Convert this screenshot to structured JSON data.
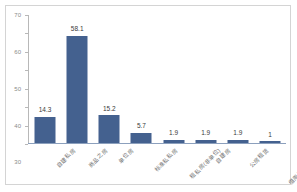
{
  "chart_data": {
    "type": "bar",
    "title": "",
    "subtitle": "",
    "xlabel": "",
    "ylabel": "",
    "ylim": [
      0,
      70
    ],
    "ytick_step": 10,
    "yticks": [
      0,
      10,
      20,
      30,
      40,
      50,
      60,
      70
    ],
    "ytick_labels": [
      "0",
      "10",
      "20",
      "30",
      "40",
      "50",
      "60",
      "70"
    ],
    "grid": false,
    "legend": false,
    "legend_position": "none",
    "categories": [
      "自建私房",
      "商品之房",
      "单位房",
      "标准私私房",
      "租私房(非单位)",
      "自建房",
      "公房租赁",
      "借用自（父母亲）"
    ],
    "values": [
      14.3,
      58.1,
      15.2,
      5.7,
      1.9,
      1.9,
      1.9,
      1
    ],
    "data_labels": [
      "14.3",
      "58.1",
      "15.2",
      "5.7",
      "1.9",
      "1.9",
      "1.9",
      "1"
    ],
    "series": [
      {
        "name": "",
        "color": "#44618f",
        "values": [
          14.3,
          58.1,
          15.2,
          5.7,
          1.9,
          1.9,
          1.9,
          1
        ]
      }
    ]
  },
  "style": {
    "bar_color": "#44618f",
    "axis_color": "#b8b8b8",
    "baseline_color": "#8ca0bd",
    "label_color": "#6f6f6f",
    "value_color": "#3a3a3a",
    "border_color": "#d4d4d4",
    "background": "#ffffff"
  }
}
